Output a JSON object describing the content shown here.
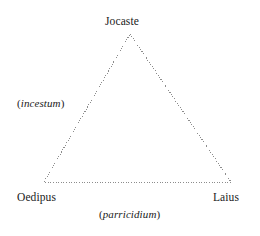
{
  "diagram": {
    "type": "triangle-relationship-diagram",
    "stroke_color": "#8c8c8c",
    "text_color": "#1a1a1a",
    "background_color": "#ffffff",
    "nodes": [
      {
        "id": "jocaste",
        "label": "Jocaste",
        "position": "apex"
      },
      {
        "id": "oedipus",
        "label": "Oedipus",
        "position": "bottom-left"
      },
      {
        "id": "laius",
        "label": "Laius",
        "position": "bottom-right"
      }
    ],
    "edges": [
      {
        "id": "incestum",
        "open_paren": "(",
        "term": "incestum",
        "close_paren": ")",
        "between": "Oedipus-Jocaste"
      },
      {
        "id": "parricidium",
        "open_paren": "(",
        "term": "parricidium",
        "close_paren": ")",
        "between": "Oedipus-Laius"
      }
    ],
    "geometry": {
      "apex_x": 130,
      "apex_y": 34,
      "left_x": 44,
      "left_y": 182,
      "right_x": 231,
      "right_y": 182
    }
  }
}
